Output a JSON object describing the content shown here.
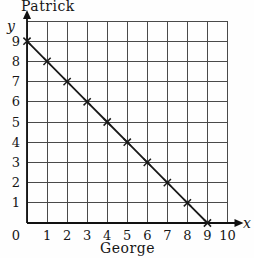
{
  "chart_data": {
    "type": "line",
    "title": "Patrick",
    "xlabel": "George",
    "x_axis_symbol": "x",
    "y_axis_symbol": "y",
    "x": [
      0,
      1,
      2,
      3,
      4,
      5,
      6,
      7,
      8,
      9
    ],
    "y": [
      9,
      8,
      7,
      6,
      5,
      4,
      3,
      2,
      1,
      0
    ],
    "x_ticks": [
      0,
      1,
      2,
      3,
      4,
      5,
      6,
      7,
      8,
      9,
      10
    ],
    "y_ticks": [
      1,
      2,
      3,
      4,
      5,
      6,
      7,
      8,
      9
    ],
    "origin_label": "0",
    "xlim": [
      0,
      10
    ],
    "ylim": [
      0,
      10
    ],
    "grid": true,
    "legend": "none",
    "marker": "x",
    "colors": {
      "line": "#1a1a1a",
      "grid": "#4a4a4a",
      "axis": "#111111",
      "text": "#161616",
      "background": "#fefefe"
    }
  }
}
